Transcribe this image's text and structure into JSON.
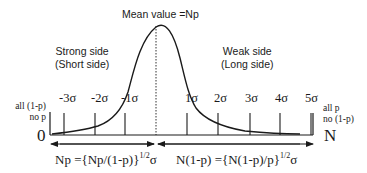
{
  "diagram": {
    "type": "skewed-distribution",
    "title": "Mean value =Np",
    "left_region": {
      "line1": "Strong side",
      "line2": "(Short side)"
    },
    "right_region": {
      "line1": "Weak side",
      "line2": "(Long side)"
    },
    "left_end": {
      "line1": "all (1-p)",
      "line2": "no p",
      "axis_value": "0"
    },
    "right_end": {
      "line1": "all p",
      "line2": "no (1-p)",
      "axis_value": "N"
    },
    "ticks": [
      {
        "label": "-3σ",
        "x": 64
      },
      {
        "label": "-2σ",
        "x": 95
      },
      {
        "label": "-1σ",
        "x": 125
      },
      {
        "label": "",
        "x": 156
      },
      {
        "label": "1σ",
        "x": 187
      },
      {
        "label": "2σ",
        "x": 218
      },
      {
        "label": "3σ",
        "x": 250
      },
      {
        "label": "4σ",
        "x": 280
      },
      {
        "label": "5σ",
        "x": 311
      }
    ],
    "left_span": {
      "lhs": "Np ={Np/(1-p)}",
      "exponent": "1/2",
      "unit": "σ"
    },
    "right_span": {
      "lhs": "N(1-p) ={N(1-p)/p}",
      "exponent": "1/2",
      "unit": "σ"
    },
    "colors": {
      "line": "#1a1a1a",
      "background": "#ffffff"
    }
  }
}
